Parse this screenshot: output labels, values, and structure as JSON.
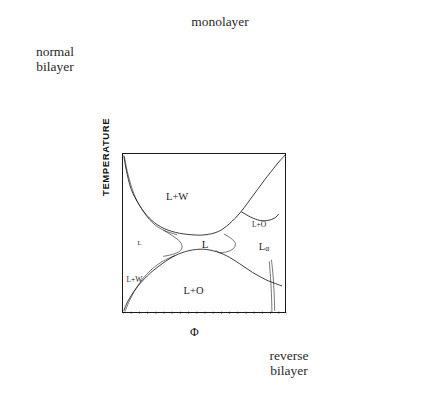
{
  "figure": {
    "kind": "phase-diagram-with-micrographs",
    "background": "#ffffff",
    "ink": "#1b1b1b"
  },
  "captions": {
    "normal_bilayer": "normal\nbilayer",
    "normal_bilayer_line1": "normal",
    "normal_bilayer_line2": "bilayer",
    "monolayer": "monolayer",
    "reverse_bilayer_line1": "reverse",
    "reverse_bilayer_line2": "bilayer"
  },
  "axes": {
    "ylabel": "TEMPERATURE",
    "xlabel": "Φ",
    "xticks": [
      "0",
      "0.5",
      "1"
    ],
    "xtick_values": [
      0,
      0.5,
      1
    ]
  },
  "chart_data": {
    "type": "line",
    "title": "",
    "xlabel": "Φ",
    "ylabel": "TEMPERATURE",
    "xlim": [
      0,
      1
    ],
    "ylim": [
      0,
      1
    ],
    "grid": false,
    "legend": "none",
    "region_labels": [
      {
        "text": "L+W",
        "x": 0.33,
        "y": 0.74,
        "size": 10.5
      },
      {
        "text": "L",
        "x": 0.5,
        "y": 0.44,
        "size": 11
      },
      {
        "text": "L+O",
        "x": 0.43,
        "y": 0.15,
        "size": 10.5
      },
      {
        "text": "L+O",
        "x": 0.83,
        "y": 0.56,
        "size": 7.5
      },
      {
        "text": "Lα",
        "x": 0.86,
        "y": 0.42,
        "size": 10.5
      },
      {
        "text": "L+W",
        "x": 0.07,
        "y": 0.22,
        "size": 7.5
      },
      {
        "text": "L",
        "x": 0.1,
        "y": 0.45,
        "size": 6.5
      }
    ],
    "series": [
      {
        "name": "upper-boundary-L+W",
        "comment": "upper fish boundary: from left wall sweeping down to the neck then up to right wall",
        "points": [
          [
            0.005,
            0.99
          ],
          [
            0.02,
            0.9
          ],
          [
            0.05,
            0.78
          ],
          [
            0.1,
            0.68
          ],
          [
            0.16,
            0.6
          ],
          [
            0.23,
            0.545
          ],
          [
            0.32,
            0.51
          ],
          [
            0.42,
            0.495
          ],
          [
            0.5,
            0.495
          ],
          [
            0.58,
            0.515
          ],
          [
            0.65,
            0.565
          ],
          [
            0.72,
            0.64
          ],
          [
            0.8,
            0.75
          ],
          [
            0.88,
            0.86
          ],
          [
            0.95,
            0.95
          ],
          [
            0.99,
            0.995
          ]
        ]
      },
      {
        "name": "lower-boundary-L+O",
        "comment": "lower fish boundary mirrored",
        "points": [
          [
            0.005,
            0.02
          ],
          [
            0.03,
            0.08
          ],
          [
            0.08,
            0.16
          ],
          [
            0.15,
            0.24
          ],
          [
            0.22,
            0.3
          ],
          [
            0.3,
            0.355
          ],
          [
            0.38,
            0.39
          ],
          [
            0.47,
            0.405
          ],
          [
            0.55,
            0.395
          ],
          [
            0.63,
            0.365
          ],
          [
            0.71,
            0.315
          ],
          [
            0.79,
            0.26
          ],
          [
            0.87,
            0.215
          ],
          [
            0.93,
            0.19
          ],
          [
            0.97,
            0.175
          ]
        ]
      },
      {
        "name": "left-fish-tail-upper",
        "comment": "thin secondary curve hugging upper-left boundary",
        "points": [
          [
            0.008,
            0.985
          ],
          [
            0.03,
            0.875
          ],
          [
            0.065,
            0.755
          ],
          [
            0.115,
            0.655
          ],
          [
            0.175,
            0.575
          ],
          [
            0.245,
            0.525
          ],
          [
            0.33,
            0.495
          ]
        ]
      },
      {
        "name": "left-tail-lower",
        "points": [
          [
            0.012,
            0.015
          ],
          [
            0.045,
            0.095
          ],
          [
            0.095,
            0.185
          ],
          [
            0.16,
            0.265
          ],
          [
            0.235,
            0.325
          ],
          [
            0.32,
            0.368
          ]
        ]
      },
      {
        "name": "inner-neck-left",
        "comment": "inner lens forming the narrow L channel on the left of neck",
        "points": [
          [
            0.245,
            0.525
          ],
          [
            0.3,
            0.49
          ],
          [
            0.345,
            0.455
          ],
          [
            0.36,
            0.42
          ],
          [
            0.345,
            0.392
          ],
          [
            0.3,
            0.372
          ],
          [
            0.245,
            0.36
          ]
        ]
      },
      {
        "name": "inner-neck-right",
        "comment": "inner lens right of the neck opening toward L-alpha",
        "points": [
          [
            0.615,
            0.5
          ],
          [
            0.66,
            0.472
          ],
          [
            0.685,
            0.44
          ],
          [
            0.672,
            0.408
          ],
          [
            0.63,
            0.388
          ],
          [
            0.585,
            0.385
          ],
          [
            0.565,
            0.4
          ]
        ]
      },
      {
        "name": "L-alpha-upper-lobe",
        "comment": "lobe bounding the L-alpha field on the right",
        "points": [
          [
            0.72,
            0.64
          ],
          [
            0.78,
            0.605
          ],
          [
            0.835,
            0.585
          ],
          [
            0.885,
            0.585
          ],
          [
            0.925,
            0.6
          ],
          [
            0.95,
            0.625
          ]
        ]
      },
      {
        "name": "right-wall-spike",
        "comment": "near-vertical pair of lines running to the bottom right corner",
        "points": [
          [
            0.905,
            0.34
          ],
          [
            0.915,
            0.24
          ],
          [
            0.922,
            0.12
          ],
          [
            0.925,
            0.02
          ]
        ]
      },
      {
        "name": "right-wall-spike-2",
        "points": [
          [
            0.892,
            0.33
          ],
          [
            0.9,
            0.22
          ],
          [
            0.906,
            0.1
          ],
          [
            0.908,
            0.01
          ]
        ]
      }
    ]
  },
  "panels": [
    {
      "id": "p-normal",
      "name": "normal-bilayer-cubic-schematic",
      "style": "cubic-light",
      "desc": "light cubic block with pale circular domains"
    },
    {
      "id": "p-mono",
      "name": "monolayer-cubic-schematic",
      "style": "cubic-light",
      "desc": "light cubic block with dark speckled spheres"
    },
    {
      "id": "p-vesL",
      "name": "vesicle-micrograph-dark-field",
      "style": "vesicle-dark",
      "desc": "dark micrograph, light circular vesicle"
    },
    {
      "id": "p-lamR",
      "name": "lamellar-micrograph-dark-field",
      "style": "lamellar-dark",
      "desc": "dark micrograph with a pale lamellar band"
    },
    {
      "id": "p-revcube",
      "name": "reverse-bilayer-cubic-schematic",
      "style": "cubic-dark",
      "desc": "cubic block with dark filled circles"
    },
    {
      "id": "p-lamL",
      "name": "lamellar-micrograph-light-field",
      "style": "lamellar-light",
      "desc": "grey micrograph with two dark dot rows"
    },
    {
      "id": "p-vesBL",
      "name": "vesicle-micrograph-light-field",
      "style": "vesicle-light",
      "desc": "grey micrograph with dark circular vesicle"
    }
  ],
  "leader_lines": [
    {
      "name": "lead-monolayer",
      "from": [
        206,
        136
      ],
      "to": [
        200,
        228
      ]
    },
    {
      "name": "lead-normal-bilayer",
      "from": [
        92,
        140
      ],
      "to": [
        128,
        185
      ]
    },
    {
      "name": "lead-vesicle-top-right",
      "from": [
        340,
        140
      ],
      "to": [
        286,
        175
      ]
    },
    {
      "name": "lead-lamellar-right",
      "from": [
        340,
        232
      ],
      "to": [
        268,
        232
      ]
    },
    {
      "name": "lead-reverse-bilayer",
      "from": [
        336,
        318
      ],
      "to": [
        268,
        262
      ]
    },
    {
      "name": "lead-lamellar-left",
      "from": [
        118,
        232
      ],
      "to": [
        150,
        234
      ]
    },
    {
      "name": "lead-vesicle-bottom-left",
      "from": [
        122,
        300
      ],
      "to": [
        150,
        262
      ]
    }
  ]
}
